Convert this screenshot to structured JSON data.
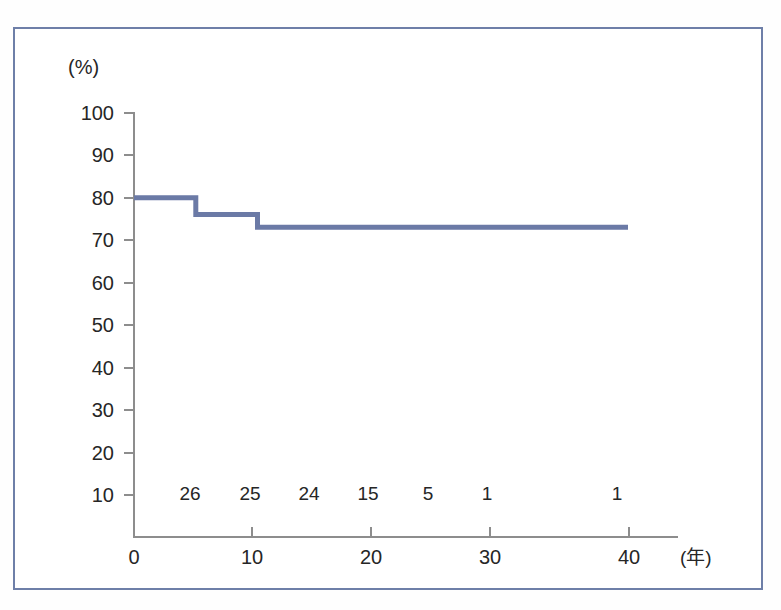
{
  "chart_data": {
    "type": "line",
    "subtype": "kaplan-meier-step",
    "title": "",
    "xlabel": "(年)",
    "ylabel": "(%)",
    "xlim": [
      0,
      42
    ],
    "ylim": [
      0,
      100
    ],
    "grid": false,
    "legend": "none",
    "x_ticks": [
      0,
      10,
      20,
      30,
      40
    ],
    "x_tick_labels": [
      "0",
      "10",
      "20",
      "30",
      "40"
    ],
    "y_ticks": [
      10,
      20,
      30,
      40,
      50,
      60,
      70,
      80,
      90,
      100
    ],
    "y_tick_labels": [
      "10",
      "20",
      "30",
      "40",
      "50",
      "60",
      "70",
      "80",
      "90",
      "100"
    ],
    "x": [
      0,
      5,
      5,
      10,
      10,
      40
    ],
    "y": [
      80,
      80,
      76,
      76,
      73,
      73
    ],
    "steps": [
      {
        "x_start": 0,
        "x_end": 5,
        "value": 80
      },
      {
        "x_start": 5,
        "x_end": 10,
        "value": 76
      },
      {
        "x_start": 10,
        "x_end": 40,
        "value": 73
      }
    ],
    "series": [
      {
        "name": "survival",
        "color": "#6b7aa6",
        "points": [
          {
            "x": 0,
            "y": 80
          },
          {
            "x": 5,
            "y": 80
          },
          {
            "x": 5,
            "y": 76
          },
          {
            "x": 10,
            "y": 76
          },
          {
            "x": 10,
            "y": 73
          },
          {
            "x": 40,
            "y": 73
          }
        ]
      }
    ],
    "numbers_at_risk": {
      "label": "",
      "x_positions": [
        5,
        10,
        15,
        20,
        25,
        30,
        40
      ],
      "values": [
        "26",
        "25",
        "24",
        "15",
        "5",
        "1",
        "1"
      ]
    }
  },
  "axes": {
    "y_unit": "(%)",
    "x_unit": "(年)",
    "y_labels": [
      "100",
      "90",
      "80",
      "70",
      "60",
      "50",
      "40",
      "30",
      "20",
      "10"
    ],
    "x_labels": [
      "0",
      "10",
      "20",
      "30",
      "40"
    ]
  },
  "risk_row": [
    "26",
    "25",
    "24",
    "15",
    "5",
    "1",
    "1"
  ],
  "colors": {
    "frame": "#6e7fa8",
    "curve": "#6b7aa6",
    "axis": "#8d8d8d",
    "text": "#262626",
    "background": "#ffffff"
  }
}
